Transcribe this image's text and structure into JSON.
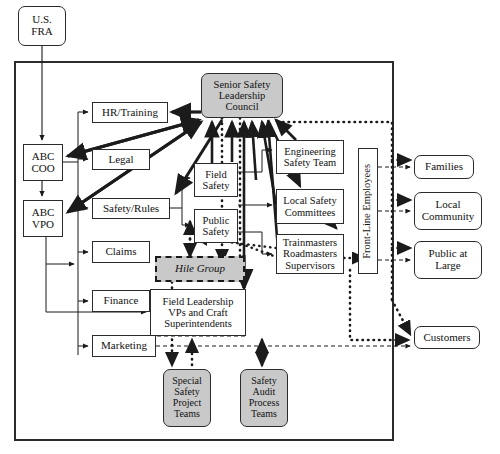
{
  "diagram": {
    "colors": {
      "shaded_fill": "#c9c9c9",
      "plain_fill": "#ffffff",
      "stroke": "#2b2b2b"
    },
    "frame": {
      "label": "organization-boundary"
    },
    "nodes": [
      {
        "id": "us-fra",
        "label": "U.S.\nFRA",
        "style": "rounded",
        "x": 18,
        "y": 6,
        "w": 48,
        "h": 40,
        "font": 11
      },
      {
        "id": "abc-coo",
        "label": "ABC\nCOO",
        "style": "plain",
        "x": 23,
        "y": 144,
        "w": 40,
        "h": 37,
        "font": 11
      },
      {
        "id": "abc-vpo",
        "label": "ABC\nVPO",
        "style": "plain",
        "x": 23,
        "y": 200,
        "w": 40,
        "h": 37,
        "font": 11
      },
      {
        "id": "hr-training",
        "label": "HR/Training",
        "style": "plain",
        "x": 92,
        "y": 102,
        "w": 76,
        "h": 21,
        "font": 11
      },
      {
        "id": "legal",
        "label": "Legal",
        "style": "plain",
        "x": 92,
        "y": 149,
        "w": 58,
        "h": 21,
        "font": 11
      },
      {
        "id": "safety-rules",
        "label": "Safety/Rules",
        "style": "plain",
        "x": 92,
        "y": 198,
        "w": 78,
        "h": 21,
        "font": 11
      },
      {
        "id": "claims",
        "label": "Claims",
        "style": "plain",
        "x": 92,
        "y": 241,
        "w": 58,
        "h": 22,
        "font": 11
      },
      {
        "id": "finance",
        "label": "Finance",
        "style": "plain",
        "x": 92,
        "y": 290,
        "w": 58,
        "h": 22,
        "font": 11
      },
      {
        "id": "marketing",
        "label": "Marketing",
        "style": "plain",
        "x": 92,
        "y": 335,
        "w": 64,
        "h": 22,
        "font": 11
      },
      {
        "id": "sslc",
        "label": "Senior Safety\nLeadership\nCouncil",
        "style": "shaded",
        "x": 201,
        "y": 73,
        "w": 82,
        "h": 45,
        "font": 10.5
      },
      {
        "id": "field-safety",
        "label": "Field\nSafety",
        "style": "plain",
        "x": 194,
        "y": 163,
        "w": 44,
        "h": 34,
        "font": 10.5
      },
      {
        "id": "public-safety",
        "label": "Public\nSafety",
        "style": "plain",
        "x": 194,
        "y": 209,
        "w": 44,
        "h": 34,
        "font": 10.5
      },
      {
        "id": "hile-group",
        "label": "Hile Group",
        "style": "shaded-dash",
        "x": 155,
        "y": 256,
        "w": 90,
        "h": 26,
        "font": 11
      },
      {
        "id": "field-leadership",
        "label": "Field Leadership\nVPs and Craft\nSuperintendents",
        "style": "plain",
        "x": 150,
        "y": 289,
        "w": 96,
        "h": 47,
        "font": 10.5
      },
      {
        "id": "special-teams",
        "label": "Special\nSafety\nProject\nTeams",
        "style": "shaded-round",
        "x": 163,
        "y": 369,
        "w": 48,
        "h": 58,
        "font": 10
      },
      {
        "id": "audit-teams",
        "label": "Safety\nAudit\nProcess\nTeams",
        "style": "shaded-round",
        "x": 240,
        "y": 369,
        "w": 48,
        "h": 58,
        "font": 10
      },
      {
        "id": "eng-safety-team",
        "label": "Engineering\nSafety Team",
        "style": "plain",
        "x": 276,
        "y": 140,
        "w": 68,
        "h": 34,
        "font": 10.5
      },
      {
        "id": "local-safety",
        "label": "Local Safety\nCommittees",
        "style": "plain",
        "x": 276,
        "y": 189,
        "w": 68,
        "h": 35,
        "font": 10.5
      },
      {
        "id": "trainmasters",
        "label": "Trainmasters\nRoadmasters\nSupervisors",
        "style": "plain",
        "x": 276,
        "y": 234,
        "w": 68,
        "h": 40,
        "font": 10.5
      },
      {
        "id": "front-line",
        "label": "Front-Line Employees",
        "style": "vertical",
        "x": 358,
        "y": 148,
        "w": 20,
        "h": 126,
        "font": 10.5
      },
      {
        "id": "families",
        "label": "Families",
        "style": "rounded",
        "x": 414,
        "y": 155,
        "w": 60,
        "h": 24,
        "font": 11
      },
      {
        "id": "local-community",
        "label": "Local\nCommunity",
        "style": "rounded",
        "x": 414,
        "y": 192,
        "w": 68,
        "h": 38,
        "font": 11
      },
      {
        "id": "public-at-large",
        "label": "Public at\nLarge",
        "style": "rounded",
        "x": 414,
        "y": 241,
        "w": 68,
        "h": 38,
        "font": 11
      },
      {
        "id": "customers",
        "label": "Customers",
        "style": "rounded",
        "x": 414,
        "y": 326,
        "w": 66,
        "h": 23,
        "font": 11
      }
    ],
    "legend": {
      "solid_line": "formal reporting relationship",
      "thick_solid_line": "primary safety influence",
      "dotted_line": "facilitation / support",
      "dashed_line": "informal communication"
    }
  }
}
